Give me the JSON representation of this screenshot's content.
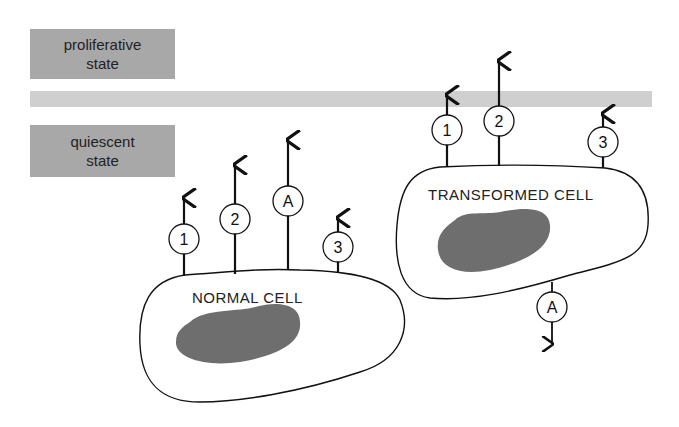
{
  "states": {
    "proliferative": [
      "proliferative",
      "state"
    ],
    "quiescent": [
      "quiescent",
      "state"
    ]
  },
  "cells": {
    "normal": {
      "label": "NORMAL CELL",
      "receptors": [
        {
          "id": "1",
          "direction": "up"
        },
        {
          "id": "2",
          "direction": "up"
        },
        {
          "id": "A",
          "direction": "up"
        },
        {
          "id": "3",
          "direction": "up"
        }
      ]
    },
    "transformed": {
      "label": "TRANSFORMED CELL",
      "receptors": [
        {
          "id": "1",
          "direction": "up"
        },
        {
          "id": "2",
          "direction": "up"
        },
        {
          "id": "3",
          "direction": "up"
        },
        {
          "id": "A",
          "direction": "down"
        }
      ]
    }
  },
  "colors": {
    "state_box": "#a8a8a8",
    "threshold_band": "#cfcfcf",
    "nucleus": "#6e6e6e",
    "line": "#111111"
  }
}
